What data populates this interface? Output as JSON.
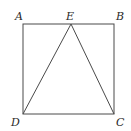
{
  "diagram": {
    "type": "geometry-figure",
    "points": {
      "A": {
        "label": "A",
        "x": 23,
        "y": 24
      },
      "B": {
        "label": "B",
        "x": 114,
        "y": 24
      },
      "C": {
        "label": "C",
        "x": 114,
        "y": 114
      },
      "D": {
        "label": "D",
        "x": 23,
        "y": 114
      },
      "E": {
        "label": "E",
        "x": 71,
        "y": 24
      }
    },
    "segments": [
      "AB",
      "BC",
      "CD",
      "DA",
      "ED",
      "EC"
    ],
    "colors": {
      "line": "#4a4a4a",
      "label": "#2a2a2a",
      "background": "#ffffff"
    }
  }
}
